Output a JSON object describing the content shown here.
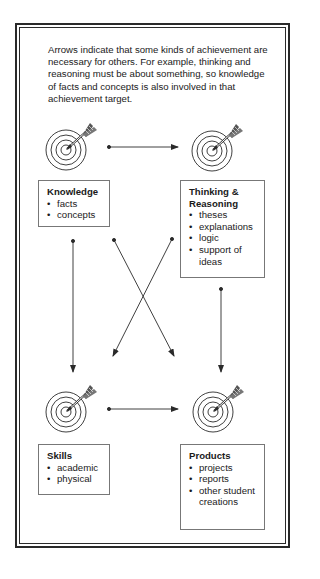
{
  "intro_text": "Arrows indicate that some kinds of achievement are necessary for others. For example, thinking and reasoning must be about something, so knowledge of facts and concepts is also involved in that achievement target.",
  "nodes": [
    {
      "id": "knowledge",
      "title": "Knowledge",
      "items": [
        "facts",
        "concepts"
      ]
    },
    {
      "id": "thinking",
      "title": "Thinking & Reasoning",
      "items": [
        "theses",
        "explanations",
        "logic",
        "support of ideas"
      ]
    },
    {
      "id": "skills",
      "title": "Skills",
      "items": [
        "academic",
        "physical"
      ]
    },
    {
      "id": "products",
      "title": "Products",
      "items": [
        "projects",
        "reports",
        "other student creations"
      ]
    }
  ],
  "arrows": [
    {
      "from": "knowledge",
      "to": "thinking"
    },
    {
      "from": "knowledge",
      "to": "skills"
    },
    {
      "from": "knowledge",
      "to": "products"
    },
    {
      "from": "thinking",
      "to": "skills"
    },
    {
      "from": "thinking",
      "to": "products"
    },
    {
      "from": "skills",
      "to": "products"
    }
  ],
  "icons": {
    "target": "target-with-arrow-icon"
  },
  "colors": {
    "line": "#2a2a2a",
    "box_border": "#777777",
    "background": "#ffffff"
  }
}
